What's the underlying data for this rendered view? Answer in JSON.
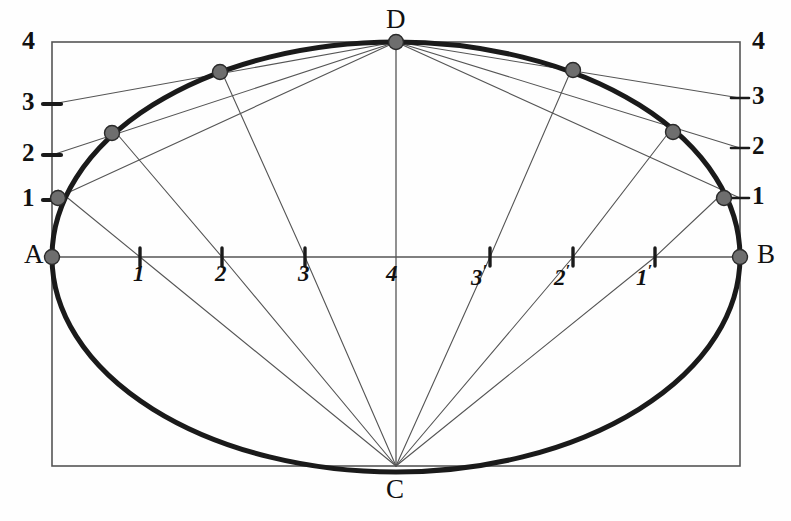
{
  "figure": {
    "type": "geometric-construction",
    "background": "#fefefe",
    "ink": "#1a1a1a",
    "thin_line": "#555555",
    "marker_fill": "#6e6e6e",
    "marker_stroke": "#2a2a2a"
  },
  "canvas": {
    "width": 791,
    "height": 521
  },
  "rect": {
    "left": 52,
    "top": 42,
    "right": 740,
    "bottom": 466
  },
  "vertices": [
    {
      "name": "A",
      "label": "A",
      "x": 52,
      "y": 257,
      "label_x": 24,
      "label_y": 244
    },
    {
      "name": "B",
      "label": "B",
      "x": 740,
      "y": 257,
      "label_x": 757,
      "label_y": 244
    },
    {
      "name": "C",
      "label": "C",
      "x": 396,
      "y": 466,
      "label_x": 385,
      "label_y": 478
    },
    {
      "name": "D",
      "label": "D",
      "x": 396,
      "y": 42,
      "label_x": 385,
      "label_y": 8
    }
  ],
  "left_axis": {
    "x": 52,
    "top_label": {
      "text": "4",
      "x": 22,
      "y": 28
    },
    "ticks": [
      {
        "label": "3",
        "y": 104,
        "label_x": 22,
        "label_y": 89
      },
      {
        "label": "2",
        "y": 155,
        "label_x": 22,
        "label_y": 140
      },
      {
        "label": "1",
        "y": 200,
        "label_x": 22,
        "label_y": 185
      }
    ]
  },
  "right_axis": {
    "x": 740,
    "top_label": {
      "text": "4",
      "x": 752,
      "y": 28
    },
    "ticks": [
      {
        "label": "3",
        "y": 98,
        "label_x": 752,
        "label_y": 83
      },
      {
        "label": "2",
        "y": 148,
        "label_x": 752,
        "label_y": 133
      },
      {
        "label": "1",
        "y": 198,
        "label_x": 752,
        "label_y": 183
      }
    ]
  },
  "horizontal_axis": {
    "y": 257,
    "center_label": {
      "text": "4",
      "x": 388,
      "y": 262
    },
    "left_ticks": [
      {
        "label": "1",
        "prime": false,
        "x": 140,
        "label_x": 133,
        "label_y": 262
      },
      {
        "label": "2",
        "prime": false,
        "x": 222,
        "label_x": 215,
        "label_y": 262
      },
      {
        "label": "3",
        "prime": false,
        "x": 305,
        "label_x": 298,
        "label_y": 262
      }
    ],
    "right_ticks": [
      {
        "label": "3",
        "prime": true,
        "x": 490,
        "label_x": 471,
        "label_y": 262
      },
      {
        "label": "2",
        "prime": true,
        "x": 573,
        "label_x": 554,
        "label_y": 262
      },
      {
        "label": "1",
        "prime": true,
        "x": 655,
        "label_x": 636,
        "label_y": 262
      }
    ]
  },
  "ellipse": {
    "cx": 396,
    "cy": 257,
    "rx": 344,
    "ry": 215,
    "stroke_width": 5
  },
  "construction_points": [
    {
      "id": "p1",
      "x": 58,
      "y": 198
    },
    {
      "id": "p2",
      "x": 112,
      "y": 133
    },
    {
      "id": "p3",
      "x": 220,
      "y": 72
    },
    {
      "id": "p4",
      "x": 396,
      "y": 42
    },
    {
      "id": "p5",
      "x": 573,
      "y": 70
    },
    {
      "id": "p6",
      "x": 673,
      "y": 132
    },
    {
      "id": "p7",
      "x": 724,
      "y": 198
    },
    {
      "id": "p8",
      "x": 740,
      "y": 257
    },
    {
      "id": "p9",
      "x": 52,
      "y": 257
    }
  ],
  "rays_from_D": [
    {
      "from_x": 396,
      "from_y": 42,
      "to_x": 52,
      "to_y": 104
    },
    {
      "from_x": 396,
      "from_y": 42,
      "to_x": 52,
      "to_y": 155
    },
    {
      "from_x": 396,
      "from_y": 42,
      "to_x": 52,
      "to_y": 200
    },
    {
      "from_x": 396,
      "from_y": 42,
      "to_x": 740,
      "to_y": 98
    },
    {
      "from_x": 396,
      "from_y": 42,
      "to_x": 740,
      "to_y": 148
    },
    {
      "from_x": 396,
      "from_y": 42,
      "to_x": 740,
      "to_y": 198
    }
  ],
  "rays_from_C": [
    {
      "from_x": 396,
      "from_y": 466,
      "to_x": 140,
      "to_y": 257
    },
    {
      "from_x": 396,
      "from_y": 466,
      "to_x": 222,
      "to_y": 257
    },
    {
      "from_x": 396,
      "from_y": 466,
      "to_x": 305,
      "to_y": 257
    },
    {
      "from_x": 396,
      "from_y": 466,
      "to_x": 490,
      "to_y": 257
    },
    {
      "from_x": 396,
      "from_y": 466,
      "to_x": 573,
      "to_y": 257
    },
    {
      "from_x": 396,
      "from_y": 466,
      "to_x": 655,
      "to_y": 257
    }
  ],
  "ray_extensions": [
    {
      "x1": 140,
      "y1": 257,
      "x2": 58,
      "y2": 190
    },
    {
      "x1": 222,
      "y1": 257,
      "x2": 112,
      "y2": 128
    },
    {
      "x1": 305,
      "y1": 257,
      "x2": 220,
      "y2": 68
    },
    {
      "x1": 490,
      "y1": 257,
      "x2": 573,
      "y2": 66
    },
    {
      "x1": 573,
      "y1": 257,
      "x2": 673,
      "y2": 127
    },
    {
      "x1": 655,
      "y1": 257,
      "x2": 724,
      "y2": 192
    }
  ],
  "center_vertical": {
    "x": 396,
    "y1": 42,
    "y2": 466
  }
}
